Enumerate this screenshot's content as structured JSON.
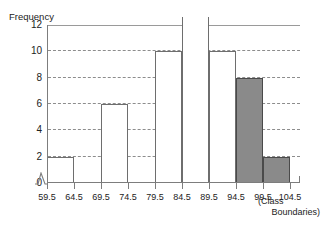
{
  "chart_data": {
    "type": "bar",
    "title": "",
    "subtitle": "",
    "ylabel": "Frequency",
    "xlabel": "(Class Boundaries)",
    "xlabel_line1": "(Class",
    "xlabel_line2": "Boundaries)",
    "grid": true,
    "legend": "none",
    "ylim": [
      0,
      12
    ],
    "ytick_labels": [
      "0",
      "2",
      "4",
      "6",
      "8",
      "10",
      "12"
    ],
    "ytick_values": [
      0,
      2,
      4,
      6,
      8,
      10,
      12
    ],
    "class_boundaries": [
      "59.5",
      "64.5",
      "69.5",
      "74.5",
      "79.5",
      "84.5",
      "89.5",
      "94.5",
      "99.5",
      "104.5"
    ],
    "class_boundary_values": [
      59.5,
      64.5,
      69.5,
      74.5,
      79.5,
      84.5,
      89.5,
      94.5,
      99.5,
      104.5
    ],
    "xlim": [
      59.5,
      104.5
    ],
    "axis_break": true,
    "bars": [
      {
        "name": "bar-59-5-64-5",
        "lower": 59.5,
        "upper": 64.5,
        "value": 2,
        "shaded": false,
        "overflow": false
      },
      {
        "name": "bar-69-5-74-5",
        "lower": 69.5,
        "upper": 74.5,
        "value": 6,
        "shaded": false,
        "overflow": false
      },
      {
        "name": "bar-79-5-84-5",
        "lower": 79.5,
        "upper": 84.5,
        "value": 10,
        "shaded": false,
        "overflow": false
      },
      {
        "name": "bar-84-5-89-5",
        "lower": 84.5,
        "upper": 89.5,
        "value": 12,
        "shaded": false,
        "overflow": true
      },
      {
        "name": "bar-89-5-94-5",
        "lower": 89.5,
        "upper": 94.5,
        "value": 10,
        "shaded": false,
        "overflow": false
      },
      {
        "name": "bar-94-5-99-5",
        "lower": 94.5,
        "upper": 99.5,
        "value": 8,
        "shaded": true,
        "overflow": false
      },
      {
        "name": "bar-99-5-104-5",
        "lower": 99.5,
        "upper": 104.5,
        "value": 2,
        "shaded": true,
        "overflow": false
      }
    ],
    "categories": [
      "59.5-64.5",
      "64.5-69.5",
      "69.5-74.5",
      "74.5-79.5",
      "79.5-84.5",
      "84.5-89.5",
      "89.5-94.5",
      "94.5-99.5",
      "99.5-104.5"
    ],
    "values": [
      2,
      0,
      6,
      0,
      10,
      12,
      10,
      8,
      2
    ],
    "colors": {
      "bar_fill": "#ffffff",
      "bar_outline": "#6e6e6e",
      "shaded_fill": "#8a8a8a",
      "shaded_outline": "#4a4a4a",
      "axis": "#7d7d7d",
      "grid": "#8d8d8d",
      "text": "#222222",
      "background": "#ffffff"
    }
  }
}
